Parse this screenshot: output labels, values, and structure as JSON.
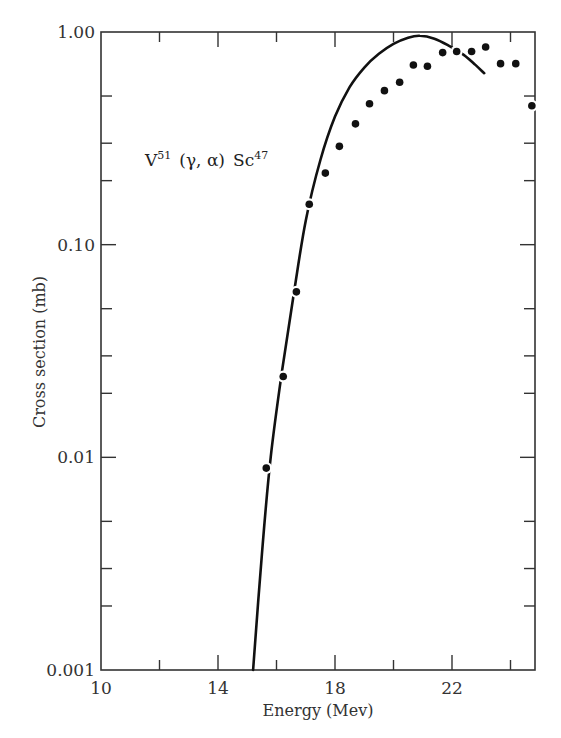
{
  "chart_data": {
    "type": "scatter",
    "title": "",
    "annotation": {
      "target": "V",
      "target_mass": "51",
      "reaction": "(γ, α)",
      "product": "Sc",
      "product_mass": "47"
    },
    "xlabel": "Energy (Mev)",
    "ylabel": "Cross section (mb)",
    "xlim": [
      10,
      25
    ],
    "ylim": [
      0.001,
      1.0
    ],
    "yscale": "log",
    "x_tick_labels": [
      "10",
      "14",
      "18",
      "22"
    ],
    "x_tick_values": [
      10,
      14,
      18,
      22
    ],
    "x_minor_ticks": [
      12,
      16,
      20,
      24
    ],
    "y_tick_labels": [
      "1.00",
      "0.10",
      "0.01",
      "0.001"
    ],
    "y_tick_values": [
      1.0,
      0.1,
      0.01,
      0.001
    ],
    "y_minor_ticks": [
      0.5,
      0.3,
      0.2,
      0.05,
      0.03,
      0.02,
      0.005,
      0.003,
      0.002
    ],
    "grid": false,
    "legend": null,
    "series": [
      {
        "name": "Measured",
        "style": "markers",
        "points": [
          {
            "x": 15.65,
            "y": 0.0089
          },
          {
            "x": 16.23,
            "y": 0.024
          },
          {
            "x": 16.68,
            "y": 0.06
          },
          {
            "x": 17.12,
            "y": 0.155
          },
          {
            "x": 17.67,
            "y": 0.217
          },
          {
            "x": 18.15,
            "y": 0.29
          },
          {
            "x": 18.7,
            "y": 0.37
          },
          {
            "x": 19.18,
            "y": 0.46
          },
          {
            "x": 19.69,
            "y": 0.53
          },
          {
            "x": 20.21,
            "y": 0.58
          },
          {
            "x": 20.68,
            "y": 0.7
          },
          {
            "x": 21.16,
            "y": 0.69
          },
          {
            "x": 21.68,
            "y": 0.8
          },
          {
            "x": 22.16,
            "y": 0.81
          },
          {
            "x": 22.67,
            "y": 0.81
          },
          {
            "x": 23.15,
            "y": 0.85
          },
          {
            "x": 23.66,
            "y": 0.71
          },
          {
            "x": 24.18,
            "y": 0.71
          },
          {
            "x": 24.73,
            "y": 0.45
          }
        ]
      },
      {
        "name": "Calculated",
        "style": "line",
        "points": [
          {
            "x": 15.2,
            "y": 0.001
          },
          {
            "x": 15.5,
            "y": 0.0035
          },
          {
            "x": 15.8,
            "y": 0.01
          },
          {
            "x": 16.2,
            "y": 0.026
          },
          {
            "x": 16.6,
            "y": 0.06
          },
          {
            "x": 17.0,
            "y": 0.13
          },
          {
            "x": 17.5,
            "y": 0.25
          },
          {
            "x": 18.0,
            "y": 0.4
          },
          {
            "x": 18.5,
            "y": 0.55
          },
          {
            "x": 19.0,
            "y": 0.68
          },
          {
            "x": 19.5,
            "y": 0.79
          },
          {
            "x": 20.0,
            "y": 0.88
          },
          {
            "x": 20.5,
            "y": 0.94
          },
          {
            "x": 20.9,
            "y": 0.96
          },
          {
            "x": 21.4,
            "y": 0.93
          },
          {
            "x": 21.9,
            "y": 0.86
          },
          {
            "x": 22.4,
            "y": 0.78
          },
          {
            "x": 22.8,
            "y": 0.7
          },
          {
            "x": 23.1,
            "y": 0.64
          }
        ]
      }
    ]
  }
}
